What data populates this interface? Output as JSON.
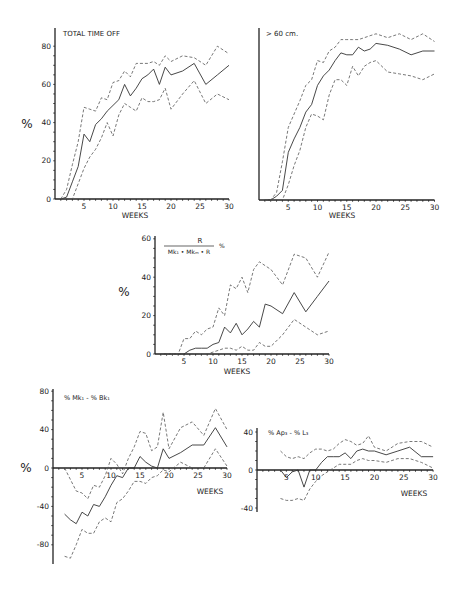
{
  "chart_data": [
    {
      "id": "total",
      "type": "line",
      "title": "TOTAL TIME OFF",
      "xlabel": "WEEKS",
      "ylabel": "%",
      "xlim": [
        0,
        30
      ],
      "ylim": [
        0,
        90
      ],
      "xticks": [
        5,
        10,
        15,
        20,
        25,
        30
      ],
      "yticks": [
        0,
        20,
        40,
        60,
        80
      ],
      "box": {
        "x0": 55,
        "y0": 199,
        "xs": 5.8,
        "ys": 1.91,
        "axis_top": 28,
        "xlabel_x": 135,
        "xlabel_y": 218,
        "ylabel_x": 27,
        "ylabel_y": 128
      },
      "series": [
        {
          "name": "mean",
          "x": [
            1,
            2,
            3,
            4,
            5,
            6,
            7,
            8,
            9,
            10,
            11,
            12,
            13,
            14,
            15,
            16,
            17,
            18,
            19,
            20,
            22,
            24,
            26,
            28,
            30
          ],
          "values": [
            0,
            1,
            9,
            17,
            34,
            30,
            39,
            42,
            46,
            49,
            52,
            60,
            54,
            58,
            63,
            65,
            68,
            60,
            69,
            65,
            67,
            71,
            60,
            65,
            70
          ]
        },
        {
          "name": "upper",
          "x": [
            1,
            2,
            3,
            4,
            5,
            6,
            7,
            8,
            9,
            10,
            11,
            12,
            13,
            14,
            15,
            16,
            17,
            18,
            19,
            20,
            22,
            24,
            26,
            28,
            30
          ],
          "values": [
            0,
            5,
            18,
            30,
            48,
            47,
            46,
            53,
            52,
            61,
            62,
            67,
            64,
            71,
            71,
            71,
            72,
            70,
            75,
            72,
            75,
            74,
            70,
            80,
            76
          ]
        },
        {
          "name": "lower",
          "x": [
            1,
            2,
            3,
            4,
            5,
            6,
            7,
            8,
            9,
            10,
            11,
            12,
            13,
            14,
            15,
            16,
            17,
            18,
            19,
            20,
            22,
            24,
            26,
            28,
            30
          ],
          "values": [
            0,
            0,
            0,
            8,
            16,
            22,
            26,
            32,
            40,
            33,
            44,
            50,
            48,
            46,
            53,
            51,
            51,
            52,
            58,
            47,
            55,
            62,
            50,
            55,
            52
          ]
        }
      ]
    },
    {
      "id": "over60",
      "type": "line",
      "title": "> 60 cm.",
      "xlabel": "WEEKS",
      "ylabel": "",
      "xlim": [
        0,
        30
      ],
      "ylim": [
        0,
        90
      ],
      "xticks": [
        5,
        10,
        15,
        20,
        25,
        30
      ],
      "yticks": [],
      "box": {
        "x0": 259,
        "y0": 200,
        "xs": 5.85,
        "ys": 1.91,
        "axis_top": 28,
        "xlabel_x": 342,
        "xlabel_y": 218
      },
      "series": [
        {
          "name": "mean",
          "x": [
            1,
            2,
            3,
            4,
            5,
            6,
            7,
            8,
            9,
            10,
            11,
            12,
            13,
            14,
            15,
            16,
            17,
            18,
            19,
            20,
            22,
            24,
            26,
            28,
            30
          ],
          "values": [
            0,
            0,
            2,
            5,
            25,
            32,
            38,
            46,
            50,
            60,
            65,
            68,
            73,
            77,
            76,
            76,
            80,
            78,
            79,
            82,
            81,
            79,
            76,
            78,
            78
          ]
        },
        {
          "name": "upper",
          "x": [
            1,
            2,
            3,
            4,
            5,
            6,
            7,
            8,
            9,
            10,
            11,
            12,
            13,
            14,
            15,
            16,
            17,
            18,
            19,
            20,
            22,
            24,
            26,
            28,
            30
          ],
          "values": [
            0,
            0,
            4,
            20,
            38,
            45,
            52,
            60,
            63,
            73,
            72,
            78,
            80,
            84,
            84,
            84,
            84,
            85,
            86,
            87,
            85,
            87,
            84,
            87,
            83
          ]
        },
        {
          "name": "lower",
          "x": [
            1,
            2,
            3,
            4,
            5,
            6,
            7,
            8,
            9,
            10,
            11,
            12,
            13,
            14,
            15,
            16,
            17,
            18,
            19,
            20,
            22,
            24,
            26,
            28,
            30
          ],
          "values": [
            0,
            0,
            0,
            0,
            8,
            18,
            26,
            38,
            45,
            44,
            42,
            55,
            63,
            63,
            60,
            70,
            65,
            70,
            72,
            73,
            67,
            66,
            65,
            63,
            66
          ]
        }
      ]
    },
    {
      "id": "ratio",
      "type": "line",
      "title": "R / (Mk1 + MkM + R) %",
      "title_num": "R",
      "title_den": "Mk₁ • Mkₘ • R",
      "title_unit": "%",
      "xlabel": "WEEKS",
      "ylabel": "%",
      "xlim": [
        0,
        30
      ],
      "ylim": [
        0,
        60
      ],
      "xticks": [
        5,
        10,
        15,
        20,
        25,
        30
      ],
      "yticks": [
        0,
        20,
        40,
        60
      ],
      "box": {
        "x0": 155,
        "y0": 354,
        "xs": 5.8,
        "ys": 1.92,
        "axis_top": 236,
        "xlabel_x": 237,
        "xlabel_y": 374,
        "ylabel_x": 124,
        "ylabel_y": 296
      },
      "series": [
        {
          "name": "mean",
          "x": [
            1,
            2,
            3,
            4,
            5,
            6,
            7,
            8,
            9,
            10,
            11,
            12,
            13,
            14,
            15,
            16,
            17,
            18,
            19,
            20,
            22,
            24,
            26,
            28,
            30
          ],
          "values": [
            0,
            0,
            0,
            0,
            0,
            2,
            3,
            3,
            3,
            5,
            6,
            14,
            11,
            16,
            10,
            13,
            17,
            14,
            26,
            25,
            21,
            32,
            22,
            30,
            38
          ]
        },
        {
          "name": "upper",
          "x": [
            1,
            2,
            3,
            4,
            5,
            6,
            7,
            8,
            9,
            10,
            11,
            12,
            13,
            14,
            15,
            16,
            17,
            18,
            19,
            20,
            22,
            24,
            26,
            28,
            30
          ],
          "values": [
            0,
            0,
            0,
            0,
            8,
            8,
            12,
            10,
            13,
            14,
            24,
            20,
            36,
            34,
            40,
            32,
            44,
            48,
            46,
            44,
            36,
            52,
            50,
            40,
            53
          ]
        },
        {
          "name": "lower",
          "x": [
            1,
            2,
            3,
            4,
            5,
            6,
            7,
            8,
            9,
            10,
            11,
            12,
            13,
            14,
            15,
            16,
            17,
            18,
            19,
            20,
            22,
            24,
            26,
            28,
            30
          ],
          "values": [
            0,
            0,
            0,
            0,
            0,
            0,
            0,
            0,
            0,
            1,
            2,
            3,
            3,
            2,
            4,
            2,
            2,
            6,
            4,
            4,
            10,
            18,
            14,
            10,
            12
          ]
        }
      ]
    },
    {
      "id": "mk_bk",
      "type": "line",
      "title": "% Mk₁ - % Bk₁",
      "xlabel": "WEEKS",
      "ylabel": "%",
      "xlim": [
        0,
        30
      ],
      "ylim": [
        -100,
        80
      ],
      "xticks": [
        5,
        10,
        15,
        20,
        25,
        30
      ],
      "yticks": [
        -80,
        -40,
        0,
        40,
        80
      ],
      "box": {
        "x0": 53,
        "y0": 468,
        "xs": 5.8,
        "ys": 0.96,
        "axis_top": 389,
        "axis_bottom": 564,
        "xlabel_x": 210,
        "xlabel_y": 494,
        "ylabel_x": 26,
        "ylabel_y": 472
      },
      "series": [
        {
          "name": "mean",
          "x": [
            2,
            3,
            4,
            5,
            6,
            7,
            8,
            9,
            10,
            11,
            12,
            13,
            14,
            15,
            16,
            17,
            18,
            19,
            20,
            22,
            24,
            26,
            28,
            30
          ],
          "values": [
            -48,
            -54,
            -58,
            -46,
            -50,
            -38,
            -40,
            -30,
            -18,
            -8,
            -10,
            0,
            0,
            12,
            6,
            2,
            0,
            20,
            10,
            16,
            24,
            24,
            42,
            22
          ]
        },
        {
          "name": "upper",
          "x": [
            2,
            3,
            4,
            5,
            6,
            7,
            8,
            9,
            10,
            11,
            12,
            13,
            14,
            15,
            16,
            17,
            18,
            19,
            20,
            22,
            24,
            26,
            28,
            30
          ],
          "values": [
            0,
            -12,
            -24,
            -26,
            -32,
            -18,
            -20,
            -8,
            10,
            4,
            -6,
            10,
            22,
            38,
            36,
            18,
            22,
            58,
            20,
            42,
            48,
            34,
            62,
            40
          ]
        },
        {
          "name": "lower",
          "x": [
            2,
            3,
            4,
            5,
            6,
            7,
            8,
            9,
            10,
            11,
            12,
            13,
            14,
            15,
            16,
            17,
            18,
            19,
            20,
            22,
            24,
            26,
            28,
            30
          ],
          "values": [
            -92,
            -94,
            -80,
            -64,
            -68,
            -68,
            -56,
            -52,
            -56,
            -36,
            -32,
            -24,
            -14,
            -14,
            -16,
            -10,
            -8,
            -2,
            -4,
            6,
            0,
            0,
            20,
            2
          ]
        }
      ]
    },
    {
      "id": "ap_l",
      "type": "line",
      "title": "% Ap₃ - % L₃",
      "xlabel": "WEEKS",
      "ylabel": "",
      "xlim": [
        0,
        30
      ],
      "ylim": [
        -45,
        45
      ],
      "xticks": [
        5,
        10,
        15,
        20,
        25,
        30
      ],
      "yticks": [
        -40,
        0,
        40
      ],
      "box": {
        "x0": 257,
        "y0": 470,
        "xs": 5.87,
        "ys": 0.95,
        "axis_top": 428,
        "axis_bottom": 512,
        "xlabel_x": 414,
        "xlabel_y": 496
      },
      "series": [
        {
          "name": "mean",
          "x": [
            4,
            5,
            6,
            7,
            8,
            9,
            10,
            11,
            12,
            13,
            14,
            15,
            16,
            17,
            18,
            19,
            20,
            22,
            24,
            26,
            28,
            30
          ],
          "values": [
            0,
            -8,
            -2,
            0,
            -18,
            0,
            0,
            8,
            14,
            14,
            14,
            18,
            12,
            20,
            22,
            20,
            20,
            16,
            20,
            24,
            14,
            14
          ]
        },
        {
          "name": "upper",
          "x": [
            4,
            5,
            6,
            7,
            8,
            9,
            10,
            11,
            12,
            13,
            14,
            15,
            16,
            17,
            18,
            19,
            20,
            22,
            24,
            26,
            28,
            30
          ],
          "values": [
            20,
            14,
            12,
            14,
            12,
            18,
            22,
            22,
            20,
            22,
            28,
            32,
            30,
            26,
            28,
            36,
            24,
            20,
            28,
            30,
            30,
            24
          ]
        },
        {
          "name": "lower",
          "x": [
            4,
            5,
            6,
            7,
            8,
            9,
            10,
            11,
            12,
            13,
            14,
            15,
            16,
            17,
            18,
            19,
            20,
            22,
            24,
            26,
            28,
            30
          ],
          "values": [
            -30,
            -32,
            -32,
            -30,
            -32,
            -20,
            -12,
            -6,
            -2,
            2,
            6,
            6,
            6,
            10,
            12,
            10,
            10,
            8,
            12,
            12,
            8,
            2
          ]
        }
      ]
    }
  ],
  "labels": {
    "total_title": "TOTAL TIME OFF",
    "over60_title": "> 60 cm.",
    "weeks": "WEEKS",
    "pct": "%",
    "ratio_num": "R",
    "ratio_den": "Mk₁ • Mkₘ • R",
    "ratio_unit": "%",
    "mk_bk_title": "% Mk₁ - % Bk₁",
    "ap_l_title": "% Ap₃ - % L₃"
  }
}
